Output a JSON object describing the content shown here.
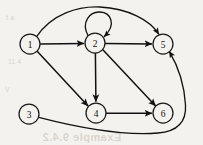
{
  "figure": {
    "type": "directed-graph",
    "background_color": "#f4f2ee",
    "stroke_color": "#111111",
    "node_radius": 10,
    "nodes": [
      {
        "id": "1",
        "label": "1",
        "cx": 30,
        "cy": 44
      },
      {
        "id": "2",
        "label": "2",
        "cx": 95,
        "cy": 43
      },
      {
        "id": "3",
        "label": "3",
        "cx": 29,
        "cy": 114
      },
      {
        "id": "4",
        "label": "4",
        "cx": 96,
        "cy": 113
      },
      {
        "id": "5",
        "label": "5",
        "cx": 163,
        "cy": 44
      },
      {
        "id": "6",
        "label": "6",
        "cx": 163,
        "cy": 113
      }
    ],
    "edges": [
      {
        "from": "1",
        "to": "2",
        "shape": "straight"
      },
      {
        "from": "1",
        "to": "4",
        "shape": "straight"
      },
      {
        "from": "1",
        "to": "5",
        "shape": "arc-over-top"
      },
      {
        "from": "2",
        "to": "2",
        "shape": "self-loop-top"
      },
      {
        "from": "2",
        "to": "5",
        "shape": "straight"
      },
      {
        "from": "2",
        "to": "4",
        "shape": "straight"
      },
      {
        "from": "2",
        "to": "6",
        "shape": "straight"
      },
      {
        "from": "4",
        "to": "6",
        "shape": "straight"
      },
      {
        "from": "3",
        "to": "5",
        "shape": "curve-around-bottom-right"
      }
    ]
  },
  "artifacts": {
    "bleed_bottom": "Example 9.4.2",
    "bleed_left_top": "t a",
    "bleed_left_mid": "11 4",
    "bleed_left_low": "V "
  }
}
